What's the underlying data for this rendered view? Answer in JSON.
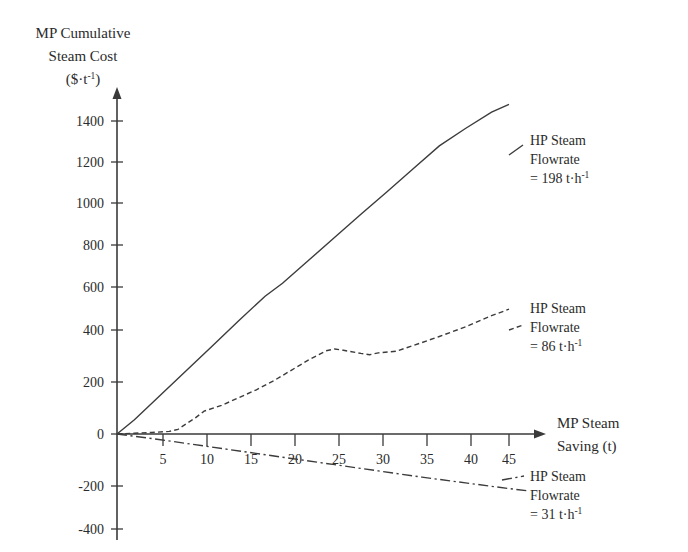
{
  "chart_data": {
    "type": "line",
    "title": "",
    "ylabel": "MP Cumulative Steam Cost ($·t⁻¹)",
    "ylabel_lines": [
      "MP Cumulative",
      "Steam Cost",
      "($·t⁻¹)"
    ],
    "xlabel": "MP Steam Saving (t)",
    "xlabel_lines": [
      "MP Steam",
      "Saving (t)"
    ],
    "xlim": [
      0,
      47.5
    ],
    "ylim": [
      -400,
      1500
    ],
    "grid": false,
    "legend_position": "inline-annotations",
    "xticks": [
      5,
      10,
      15,
      20,
      25,
      30,
      35,
      40,
      45
    ],
    "yticks": [
      -400,
      -200,
      0,
      200,
      400,
      600,
      800,
      1000,
      1200,
      1400
    ],
    "series": [
      {
        "name": "HP Steam Flowrate = 198 t·h⁻¹",
        "style": "solid",
        "annotation_lines": [
          "HP Steam",
          "Flowrate",
          "= 198 t·h⁻¹"
        ],
        "x": [
          0,
          2,
          5,
          8,
          11,
          14,
          17,
          19,
          22,
          25,
          28,
          31,
          34,
          37,
          40,
          43,
          45
        ],
        "y": [
          0,
          55,
          150,
          245,
          340,
          437,
          530,
          580,
          668,
          757,
          845,
          932,
          1020,
          1108,
          1175,
          1238,
          1268
        ]
      },
      {
        "name": "HP Steam Flowrate = 86 t·h⁻¹",
        "style": "dashed",
        "annotation_lines": [
          "HP Steam",
          "Flowrate",
          "= 86 t·h⁻¹"
        ],
        "x": [
          0,
          2,
          4,
          6,
          7,
          9,
          10,
          12,
          14,
          16,
          18,
          20,
          22,
          24,
          25,
          26,
          28,
          29,
          30,
          32,
          34,
          37,
          40,
          43,
          45
        ],
        "y": [
          0,
          3,
          6,
          10,
          18,
          62,
          88,
          110,
          140,
          170,
          205,
          245,
          285,
          320,
          327,
          322,
          310,
          305,
          312,
          318,
          340,
          375,
          412,
          455,
          480
        ]
      },
      {
        "name": "HP Steam Flowrate = 31 t·h⁻¹",
        "style": "dash-dot",
        "annotation_lines": [
          "HP Steam",
          "Flowrate",
          "= 31 t·h⁻¹"
        ],
        "x": [
          0,
          5,
          10,
          15,
          20,
          25,
          30,
          35,
          40,
          45,
          47
        ],
        "y": [
          0,
          -22,
          -46,
          -70,
          -94,
          -118,
          -142,
          -166,
          -188,
          -210,
          -218
        ]
      }
    ]
  },
  "axes": {
    "y_axis_label_line1": "MP Cumulative",
    "y_axis_label_line2": "Steam Cost",
    "y_axis_label_line3_base": "($·t",
    "y_axis_label_line3_sup": "-1",
    "y_axis_label_line3_close": ")",
    "x_axis_label_line1": "MP Steam",
    "x_axis_label_line2": "Saving (t)"
  },
  "annotations": {
    "series1": {
      "line1": "HP Steam",
      "line2": "Flowrate",
      "line3_base": "= 198 t·h",
      "line3_sup": "-1"
    },
    "series2": {
      "line1": "HP Steam",
      "line2": "Flowrate",
      "line3_base": "= 86 t·h",
      "line3_sup": "-1"
    },
    "series3": {
      "line1": "HP Steam",
      "line2": "Flowrate",
      "line3_base": "= 31 t·h",
      "line3_sup": "-1"
    }
  },
  "ticks": {
    "y": [
      "1400",
      "1200",
      "1000",
      "800",
      "600",
      "400",
      "200",
      "0",
      "-200",
      "-400"
    ],
    "x": [
      "5",
      "10",
      "15",
      "20",
      "25",
      "30",
      "35",
      "40",
      "45"
    ]
  },
  "colors": {
    "background": "#ffffff",
    "ink": "#2b2b2b",
    "axis": "#3a3a3a",
    "series": "#3c3c3c"
  }
}
